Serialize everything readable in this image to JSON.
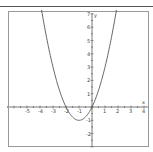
{
  "chart_data": {
    "type": "line",
    "title": "",
    "xlabel": "x",
    "ylabel": "y",
    "function": "y = x^2 + 2x",
    "xlim": [
      -6.5,
      4.3
    ],
    "ylim": [
      -3,
      7.3
    ],
    "x_ticks": [
      -5,
      -4,
      -3,
      -2,
      -1,
      1,
      2,
      3,
      4
    ],
    "y_ticks": [
      7,
      6,
      5,
      4,
      3,
      2,
      1,
      -1,
      -2
    ],
    "grid": false,
    "legend": null,
    "series": [
      {
        "name": "parabola",
        "color": "#555555",
        "x": [
          -3.83,
          -3.5,
          -3,
          -2.5,
          -2,
          -1.5,
          -1,
          -0.5,
          0,
          0.5,
          1,
          1.5,
          1.83
        ],
        "y": [
          7,
          5.25,
          3,
          1.25,
          0,
          -0.75,
          -1,
          -0.75,
          0,
          1.25,
          3,
          5.25,
          7
        ]
      }
    ],
    "key_points": {
      "roots": [
        -2,
        0
      ],
      "vertex": [
        -1,
        -1
      ],
      "y_intercept": 0
    }
  },
  "axes": {
    "x_name": "x",
    "y_name": "y",
    "x_labels": [
      "-5",
      "-4",
      "-3",
      "-2",
      "-1",
      "1",
      "2",
      "3",
      "4"
    ],
    "y_labels": [
      "7",
      "6",
      "5",
      "4",
      "3",
      "2",
      "1",
      "-1",
      "-2"
    ]
  },
  "colors": {
    "frame": "#999999",
    "axis": "#555555",
    "curve": "#555555",
    "rule": "#555555"
  }
}
